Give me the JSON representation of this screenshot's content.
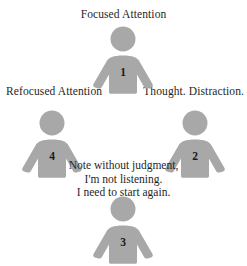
{
  "diagram": {
    "title": "Focused Attention",
    "background_color": "#ffffff",
    "figure_color": "#a8a8a8",
    "text_color": "#1f1f1f",
    "labels": {
      "top": "Focused Attention",
      "left": "Refocused Attention",
      "right": "Thought. Distraction."
    },
    "center_note": {
      "line1": "Note without judgment,",
      "line2": "I'm not listening.",
      "line3": "I need to start again."
    },
    "figures": [
      {
        "id": "figure-1",
        "number": "1",
        "position": "top",
        "label": "Focused Attention"
      },
      {
        "id": "figure-2",
        "number": "2",
        "position": "right",
        "label": "Thought. Distraction."
      },
      {
        "id": "figure-3",
        "number": "3",
        "position": "bottom",
        "label": ""
      },
      {
        "id": "figure-4",
        "number": "4",
        "position": "left",
        "label": "Refocused Attention"
      }
    ]
  }
}
